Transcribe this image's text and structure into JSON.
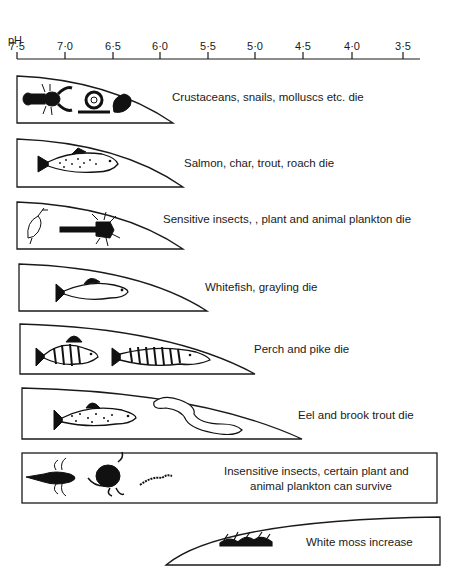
{
  "axis": {
    "title": "pH",
    "ticks": [
      "7·5",
      "7·0",
      "6·5",
      "6·0",
      "5·5",
      "5·0",
      "4·5",
      "4·0",
      "3·5"
    ],
    "tick_x": [
      17,
      65,
      113,
      160,
      208,
      255,
      303,
      352,
      403
    ]
  },
  "bands": [
    {
      "label": "Crustaceans, snails, molluscs etc. die",
      "ph_limit": "~6.1",
      "icons": [
        "crayfish-icon",
        "snail-icon",
        "mussel-icon"
      ]
    },
    {
      "label": "Salmon, char, trout, roach die",
      "ph_limit": "~5.8",
      "icons": [
        "salmon-icon"
      ]
    },
    {
      "label": "Sensitive insects, , plant and animal plankton die",
      "ph_limit": "~5.8",
      "icons": [
        "mayfly-icon",
        "insect-larva-icon"
      ]
    },
    {
      "label": "Whitefish, grayling die",
      "ph_limit": "~5.5",
      "icons": [
        "whitefish-icon"
      ]
    },
    {
      "label": "Perch and pike die",
      "ph_limit": "~5.0",
      "icons": [
        "perch-icon",
        "pike-icon"
      ]
    },
    {
      "label": "Eel and brook trout die",
      "ph_limit": "~4.5",
      "icons": [
        "brook-trout-icon",
        "eel-icon"
      ]
    },
    {
      "label_line1": "Insensitive insects, certain plant and",
      "label_line2": "animal plankton can survive",
      "ph_range": "7.5–3.5",
      "icons": [
        "dragonfly-larva-icon",
        "water-beetle-icon",
        "worm-icon"
      ]
    },
    {
      "label": "White moss increase",
      "ph_range": "6.0–3.5",
      "icons": [
        "moss-icon"
      ]
    }
  ]
}
